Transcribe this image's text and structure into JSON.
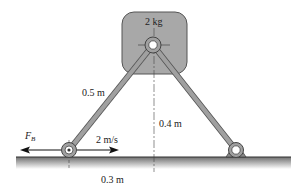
{
  "diagram": {
    "title": "",
    "block": {
      "mass_label": "2 kg",
      "fill": "#a9a9a9",
      "stroke": "#555555"
    },
    "links": {
      "left_length_label": "0.5 m",
      "color": "#9a9a9a"
    },
    "dimensions": {
      "height_label": "0.4 m",
      "horizontal_label": "0.3 m"
    },
    "force": {
      "symbol": "F",
      "subscript": "B"
    },
    "velocity": {
      "label": "2 m/s"
    },
    "ground": {
      "color": "#7a7a7a"
    }
  }
}
